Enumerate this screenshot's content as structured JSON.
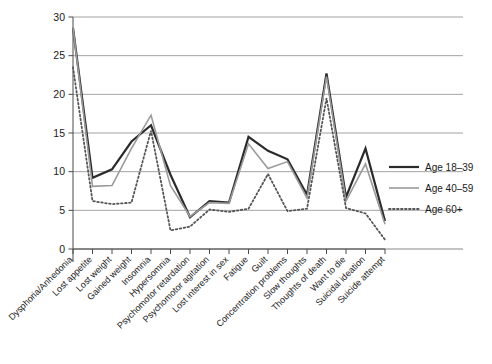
{
  "chart_data": {
    "type": "line",
    "title": "",
    "xlabel": "",
    "ylabel": "",
    "ylim": [
      0,
      30
    ],
    "yticks": [
      0,
      5,
      10,
      15,
      20,
      25,
      30
    ],
    "grid": true,
    "legend_position": "right",
    "categories": [
      "Dysphoria/Anhedonia",
      "Lost appetite",
      "Lost weight",
      "Gained weight",
      "Insomnia",
      "Hypersomnia",
      "Psychomotor retardation",
      "Psychomotor agitation",
      "Lost interest in sex",
      "Fatigue",
      "Guilt",
      "Concentration problems",
      "Slow thoughts",
      "Thoughts of death",
      "Want to die",
      "Suicidal ideation",
      "Suicide attempt"
    ],
    "series": [
      {
        "name": "Age 18–39",
        "color": "#2b2b2b",
        "style": "solid",
        "width": 2.2,
        "values": [
          28.6,
          9.2,
          10.3,
          13.9,
          16.0,
          9.6,
          4.1,
          6.2,
          6.0,
          14.5,
          12.7,
          11.6,
          7.0,
          22.7,
          6.7,
          13.0,
          3.6
        ]
      },
      {
        "name": "Age 40–59",
        "color": "#9a9a9a",
        "style": "solid",
        "width": 1.6,
        "values": [
          28.6,
          8.1,
          8.2,
          13.0,
          17.3,
          8.2,
          4.2,
          6.0,
          5.9,
          13.6,
          10.4,
          11.3,
          6.6,
          22.3,
          6.2,
          11.0,
          3.2
        ]
      },
      {
        "name": "Age 60+",
        "color": "#555555",
        "style": "dotted",
        "width": 1.8,
        "values": [
          23.5,
          6.2,
          5.8,
          6.0,
          15.3,
          2.4,
          2.9,
          5.1,
          4.8,
          5.2,
          9.7,
          4.9,
          5.2,
          19.5,
          5.3,
          4.6,
          1.2
        ]
      }
    ]
  },
  "legend": {
    "items": [
      {
        "label": "Age 18–39"
      },
      {
        "label": "Age 40–59"
      },
      {
        "label": "Age 60+"
      }
    ]
  }
}
